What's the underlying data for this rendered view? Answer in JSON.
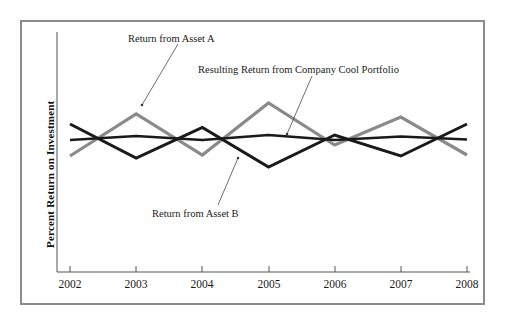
{
  "chart_data": {
    "type": "line",
    "title": "",
    "xlabel": "",
    "ylabel": "Percent Return on Investment",
    "grid": false,
    "legend_position": "annotations-inline",
    "x": [
      2002,
      2003,
      2004,
      2005,
      2006,
      2007,
      2008
    ],
    "tick_labels": [
      "2002",
      "2003",
      "2004",
      "2005",
      "2006",
      "2007",
      "2008"
    ],
    "ylim": [
      -10,
      10
    ],
    "y_axis_ticks_shown": false,
    "series": [
      {
        "name": "Return from Asset A",
        "color": "#8a8a8a",
        "values": [
          -3.2,
          5.2,
          -3.0,
          7.4,
          -1.0,
          4.6,
          -3.0
        ]
      },
      {
        "name": "Return from Asset B",
        "color": "#1a1a1a",
        "values": [
          3.2,
          -3.6,
          2.5,
          -5.4,
          1.0,
          -3.2,
          3.2
        ]
      },
      {
        "name": "Resulting Return from Company Cool Portfolio",
        "color": "#1a1a1a",
        "values": [
          0.0,
          0.8,
          0.0,
          1.0,
          0.0,
          0.7,
          0.1
        ]
      }
    ],
    "annotations": [
      {
        "label": "Return from Asset A",
        "points_to": "Asset A peak at 2003"
      },
      {
        "label": "Resulting Return from Company Cool Portfolio",
        "points_to": "Portfolio line near 2005"
      },
      {
        "label": "Return from Asset B",
        "points_to": "Asset B decline near 2005"
      }
    ]
  },
  "axis": {
    "y_label": "Percent Return on Investment",
    "x_ticks": [
      "2002",
      "2003",
      "2004",
      "2005",
      "2006",
      "2007",
      "2008"
    ]
  },
  "annotations": {
    "asset_a": "Return from Asset A",
    "portfolio": "Resulting Return from Company Cool Portfolio",
    "asset_b": "Return from Asset B"
  },
  "colors": {
    "asset_a": "#8a8a8a",
    "asset_b": "#1a1a1a",
    "portfolio": "#1a1a1a",
    "frame": "#8c8c8c",
    "axis": "#555555",
    "background": "#ffffff"
  }
}
